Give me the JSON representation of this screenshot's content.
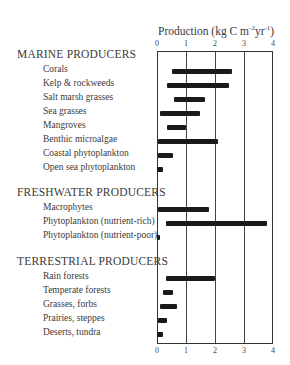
{
  "chart_data": {
    "type": "bar",
    "orientation": "horizontal-range",
    "title": "Production (kg C m-2yr-1)",
    "xlabel": "Production (kg C m⁻²yr⁻¹)",
    "ylabel": "",
    "xlim": [
      0,
      4
    ],
    "xticks": [
      "0",
      "1",
      "2",
      "3",
      "4"
    ],
    "grid": true,
    "groups": [
      {
        "name": "MARINE PRODUCERS",
        "items": [
          {
            "label": "Corals",
            "min": 0.5,
            "max": 2.6
          },
          {
            "label": "Kelp & rockweeds",
            "min": 0.35,
            "max": 2.5
          },
          {
            "label": "Salt marsh grasses",
            "min": 0.6,
            "max": 1.65
          },
          {
            "label": "Sea grasses",
            "min": 0.1,
            "max": 1.5
          },
          {
            "label": "Mangroves",
            "min": 0.35,
            "max": 1.0
          },
          {
            "label": "Benthic microalgae",
            "min": 0.05,
            "max": 2.1
          },
          {
            "label": "Coastal phytoplankton",
            "min": 0.05,
            "max": 0.55
          },
          {
            "label": "Open sea phytoplankton",
            "min": 0.0,
            "max": 0.2
          }
        ]
      },
      {
        "name": "FRESHWATER PRODUCERS",
        "items": [
          {
            "label": "Macrophytes",
            "min": 0.05,
            "max": 1.8
          },
          {
            "label": "Phytoplankton (nutrient-rich)",
            "min": 0.3,
            "max": 3.8
          },
          {
            "label": "Phytoplankton (nutrient-poor)",
            "min": 0.0,
            "max": 0.1
          }
        ]
      },
      {
        "name": "TERRESTRIAL PRODUCERS",
        "items": [
          {
            "label": "Rain forests",
            "min": 0.3,
            "max": 2.0
          },
          {
            "label": "Temperate forests",
            "min": 0.2,
            "max": 0.55
          },
          {
            "label": "Grasses,  forbs",
            "min": 0.1,
            "max": 0.7
          },
          {
            "label": "Prairies,  steppes",
            "min": 0.05,
            "max": 0.35
          },
          {
            "label": "Deserts,  tundra",
            "min": 0.0,
            "max": 0.2
          }
        ]
      }
    ]
  },
  "axis": {
    "title_main": "Production (kg C m",
    "title_sup1": "-2",
    "title_mid": "yr",
    "title_sup2": "-1",
    "title_end": ")"
  }
}
